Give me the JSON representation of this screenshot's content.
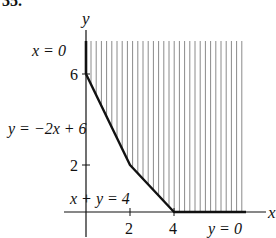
{
  "problem_number": "35.",
  "axes": {
    "x_label": "x",
    "y_label": "y",
    "x_ticks": [
      "2",
      "4"
    ],
    "y_ticks": [
      "2",
      "6"
    ]
  },
  "boundaries": [
    {
      "label": "x = 0",
      "equation": "x = 0"
    },
    {
      "label": "y = −2x + 6",
      "equation": "y = -2x + 6"
    },
    {
      "label": "x + y = 4",
      "equation": "x + y = 4"
    },
    {
      "label": "y = 0",
      "equation": "y = 0"
    }
  ],
  "vertices": [
    [
      0,
      6
    ],
    [
      2,
      2
    ],
    [
      4,
      0
    ]
  ],
  "region": "unbounded, shaded with vertical hatching above the boundary polyline",
  "colors": {
    "ink": "#111111",
    "hatch": "#8a8a8a",
    "background": "#ffffff"
  }
}
